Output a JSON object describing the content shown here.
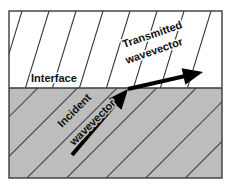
{
  "figure": {
    "width": 232,
    "height": 185,
    "frame": {
      "x": 9,
      "y": 11,
      "width": 213,
      "height": 167,
      "stroke": "#3a3a3a",
      "stroke_width": 1.4
    },
    "background": "#ffffff"
  },
  "media": {
    "upper": {
      "name": "upper-medium",
      "fill": "#ffffff",
      "region": {
        "x": 9,
        "y": 11,
        "width": 213,
        "height": 77
      },
      "wavefronts": {
        "count": 9,
        "spacing_px": 27,
        "tilt_from_vertical_deg": 17,
        "stroke": "#3a3a3a",
        "stroke_width": 1.1
      }
    },
    "lower": {
      "name": "lower-medium",
      "fill": "#bdbdbd",
      "region": {
        "x": 9,
        "y": 88,
        "width": 213,
        "height": 90
      },
      "wavefronts": {
        "count": 13,
        "spacing_px": 28,
        "angle_from_horizontal_deg": 45,
        "stroke": "#4a4a4a",
        "stroke_width": 1.1
      }
    }
  },
  "interface": {
    "label": "Interface",
    "y": 88,
    "x_start": 9,
    "x_end": 222,
    "stroke": "#3a3a3a",
    "stroke_width": 1.3,
    "label_position": {
      "x": 31,
      "y": 82
    },
    "label_font_size": 11
  },
  "vectors": {
    "incident": {
      "label_line1": "Incident",
      "label_line2": "wavevector",
      "tail": {
        "x": 72,
        "y": 155
      },
      "tip": {
        "x": 128,
        "y": 89
      },
      "angle_deg": 45,
      "color": "#000000",
      "shaft_width": 4,
      "label_rotation_deg": -45,
      "label_anchor": {
        "x": 62,
        "y": 128
      },
      "label_font_size": 11
    },
    "transmitted": {
      "label_line1": "Transmitted",
      "label_line2": "wavevector",
      "tail": {
        "x": 128,
        "y": 89
      },
      "tip": {
        "x": 203,
        "y": 72
      },
      "angle_deg": -13,
      "color": "#000000",
      "shaft_width": 4,
      "label_rotation_deg": -19,
      "label_anchor": {
        "x": 124,
        "y": 48
      },
      "label_font_size": 11
    }
  },
  "colors": {
    "ink": "#111111",
    "frame_line": "#3a3a3a",
    "gray_medium": "#bdbdbd",
    "white_medium": "#ffffff",
    "arrow": "#000000"
  }
}
